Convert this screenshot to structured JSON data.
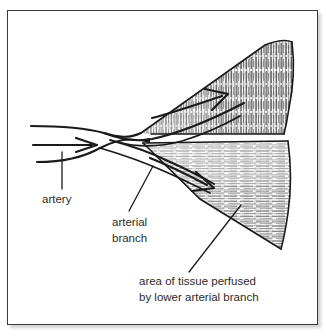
{
  "figure": {
    "style": "black-and-white ink line drawing with hatched shading",
    "background_color": "#ffffff",
    "ink_color": "#1a1a1a",
    "frame_color": "#3a3a3a"
  },
  "labels": {
    "artery": {
      "text": "artery",
      "lines": [
        "artery"
      ],
      "x": 42,
      "y": 200
    },
    "arterial_branch": {
      "text": "arterial branch",
      "lines": [
        "arterial",
        "branch"
      ],
      "x": 112,
      "y": 225
    },
    "perfused_area": {
      "text": "area of tissue perfused by lower arterial branch",
      "lines": [
        "area of tissue perfused",
        "by lower arterial branch"
      ],
      "x": 139,
      "y": 285
    }
  },
  "structures": {
    "artery_trunk": "main artery entering from the left",
    "upper_branch": "upper arterial branch angling up and to the right",
    "lower_branch": "lower arterial branch angling down and to the right",
    "upper_wedge": "upper wedge of tissue with dense vertical hatching",
    "lower_wedge": "lower wedge of tissue with horizontal hatching",
    "upper_flow_arrow": "arrow showing blood flow into upper tissue wedge",
    "lower_flow_arrow": "arrow showing blood flow into lower tissue wedge",
    "trunk_flow_arrow": "arrow showing blood flow direction in the main artery"
  },
  "leader_lines": {
    "artery": "vertical leader from the artery label up to the artery trunk",
    "arterial_branch": "diagonal leader from the arterial branch label up to the lower branch vessel",
    "perfused_area": "long diagonal leader from the caption up into the lower tissue wedge"
  }
}
